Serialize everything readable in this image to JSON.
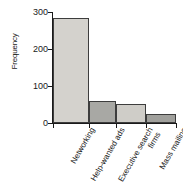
{
  "chart_data": {
    "type": "bar",
    "title": "",
    "subtitle": "",
    "xlabel": "",
    "ylabel": "Frequency",
    "categories": [
      "Networking",
      "Help-wanted ads",
      "Executive search firms",
      "Mass mailing"
    ],
    "category_lines": [
      [
        "Networking"
      ],
      [
        "Help-wanted ads"
      ],
      [
        "Executive search",
        "firms"
      ],
      [
        "Mass mailing"
      ]
    ],
    "values": [
      285,
      60,
      50,
      25
    ],
    "ylim": [
      0,
      300
    ],
    "yticks": [
      0,
      100,
      200,
      300
    ],
    "ytick_labels": [
      "0",
      "100",
      "200",
      "300"
    ],
    "grid": false,
    "legend": false,
    "legend_position": "none",
    "bar_colors": [
      "#d4d2cd",
      "#a8a8a4",
      "#cfcdc8",
      "#a0a09c"
    ],
    "bar_edge_color": "#3d3d3d",
    "axis_color": "#1a1a1a",
    "background_color": "#ffffff"
  }
}
